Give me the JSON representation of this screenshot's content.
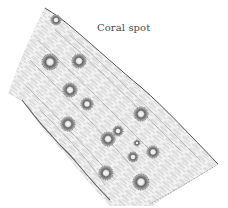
{
  "illustration": {
    "caption": "Coral spot",
    "subject": "branch-with-coral-spot-pustules",
    "colors": {
      "background": "#ffffff",
      "ink": "#3a3a3a",
      "grain": "#8a8a8a",
      "spot_ring": "#4a4a4a",
      "spot_center": "#f4f4f4"
    },
    "spots": [
      {
        "x": 56,
        "y": 20,
        "r": 5
      },
      {
        "x": 50,
        "y": 62,
        "r": 8
      },
      {
        "x": 79,
        "y": 61,
        "r": 7
      },
      {
        "x": 70,
        "y": 90,
        "r": 7
      },
      {
        "x": 87,
        "y": 104,
        "r": 6
      },
      {
        "x": 90,
        "y": 108,
        "r": 5
      },
      {
        "x": 141,
        "y": 114,
        "r": 7
      },
      {
        "x": 68,
        "y": 124,
        "r": 7
      },
      {
        "x": 108,
        "y": 139,
        "r": 7
      },
      {
        "x": 118,
        "y": 131,
        "r": 5
      },
      {
        "x": 137,
        "y": 143,
        "r": 3
      },
      {
        "x": 133,
        "y": 157,
        "r": 5
      },
      {
        "x": 153,
        "y": 152,
        "r": 6
      },
      {
        "x": 106,
        "y": 173,
        "r": 7
      },
      {
        "x": 141,
        "y": 182,
        "r": 8
      }
    ]
  }
}
